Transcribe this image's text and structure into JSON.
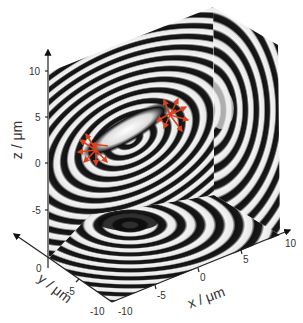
{
  "figure": {
    "colors": {
      "fringe_dark": "#111111",
      "fringe_light": "#f2f2f2",
      "arrow": "#e0401c",
      "axis": "#222222",
      "text": "#333333"
    },
    "axes": {
      "z": {
        "label": "z / μm",
        "ticks": [
          "10",
          "5",
          "0",
          "-5"
        ]
      },
      "y": {
        "label": "y / μm",
        "ticks": [
          "0",
          "-5",
          "-10"
        ]
      },
      "x": {
        "label": "x / μm",
        "ticks": [
          "-10",
          "-5",
          "0",
          "5",
          "10"
        ]
      }
    },
    "annotations": {
      "arrow_groups": 2
    }
  }
}
